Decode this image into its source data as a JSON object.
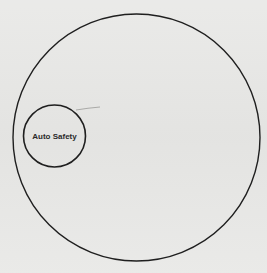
{
  "diagram": {
    "type": "nested-circles",
    "outer_circle": {
      "label": "",
      "cx": 136.5,
      "cy": 137.5,
      "r": 123.5,
      "stroke": "#1f1f1f"
    },
    "inner_circle": {
      "label": "Auto Safety",
      "cx": 54.5,
      "cy": 136,
      "r": 31,
      "stroke": "#1f1f1f"
    },
    "background": "#e8e8e6"
  }
}
